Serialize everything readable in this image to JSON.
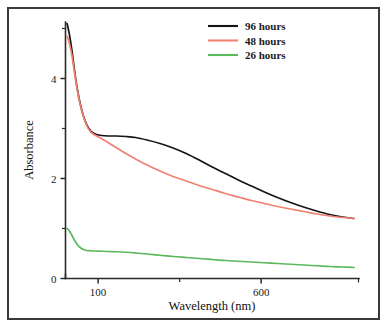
{
  "figure": {
    "border_color": "#3a3a3a",
    "background": "#ffffff"
  },
  "legend": {
    "position": "top-right",
    "entries": [
      {
        "label": "96 hours",
        "color": "#151515"
      },
      {
        "label": "48 hours",
        "color": "#f08070"
      },
      {
        "label": "26 hours",
        "color": "#5cb85c"
      }
    ]
  },
  "axes": {
    "x_title": "Wavelength (nm)",
    "y_title": "Absorbance",
    "x_tick_labels": [
      "100",
      "600"
    ],
    "y_tick_labels": [
      "0",
      "2",
      "4"
    ]
  },
  "chart_data": {
    "type": "line",
    "title": "",
    "xlabel": "Wavelength (nm)",
    "ylabel": "Absorbance",
    "xlim": [
      0,
      900
    ],
    "ylim": [
      0,
      5.4
    ],
    "grid": false,
    "legend_position": "top-right",
    "x_ticks": [
      100,
      600
    ],
    "x_tick_labels": [
      "100",
      "600"
    ],
    "y_ticks": [
      0,
      2,
      4
    ],
    "y_tick_labels": [
      "0",
      "2",
      "4"
    ],
    "y_minor_ticks": [
      1,
      3,
      5
    ],
    "series": [
      {
        "name": "96 hours",
        "color": "#151515",
        "x": [
          5,
          12,
          20,
          28,
          36,
          45,
          55,
          65,
          75,
          85,
          95,
          110,
          130,
          155,
          185,
          215,
          250,
          290,
          330,
          370,
          410,
          450,
          490,
          530,
          570,
          610,
          650,
          690,
          730,
          770,
          810,
          850,
          885
        ],
        "y": [
          5.1,
          4.88,
          4.55,
          4.15,
          3.8,
          3.5,
          3.25,
          3.08,
          2.97,
          2.91,
          2.88,
          2.86,
          2.85,
          2.85,
          2.84,
          2.82,
          2.77,
          2.7,
          2.61,
          2.5,
          2.37,
          2.23,
          2.1,
          1.97,
          1.85,
          1.73,
          1.62,
          1.52,
          1.43,
          1.35,
          1.28,
          1.23,
          1.2
        ]
      },
      {
        "name": "48 hours",
        "color": "#f08070",
        "x": [
          5,
          12,
          20,
          28,
          36,
          45,
          55,
          65,
          75,
          85,
          95,
          110,
          130,
          155,
          185,
          215,
          250,
          290,
          330,
          370,
          410,
          450,
          490,
          530,
          570,
          610,
          650,
          690,
          730,
          770,
          810,
          850,
          885
        ],
        "y": [
          4.85,
          4.7,
          4.45,
          4.1,
          3.78,
          3.48,
          3.24,
          3.06,
          2.95,
          2.89,
          2.85,
          2.8,
          2.72,
          2.62,
          2.5,
          2.39,
          2.27,
          2.15,
          2.04,
          1.95,
          1.86,
          1.78,
          1.7,
          1.63,
          1.56,
          1.5,
          1.44,
          1.39,
          1.34,
          1.29,
          1.25,
          1.22,
          1.2
        ]
      },
      {
        "name": "26 hours",
        "color": "#5cb85c",
        "x": [
          5,
          12,
          20,
          28,
          36,
          45,
          55,
          65,
          75,
          85,
          95,
          110,
          130,
          155,
          185,
          215,
          250,
          290,
          330,
          370,
          410,
          450,
          490,
          530,
          570,
          610,
          650,
          690,
          730,
          770,
          810,
          850,
          885
        ],
        "y": [
          1.0,
          0.95,
          0.86,
          0.76,
          0.68,
          0.62,
          0.58,
          0.56,
          0.555,
          0.55,
          0.55,
          0.545,
          0.54,
          0.535,
          0.525,
          0.51,
          0.49,
          0.465,
          0.44,
          0.42,
          0.4,
          0.38,
          0.36,
          0.345,
          0.33,
          0.315,
          0.3,
          0.285,
          0.27,
          0.255,
          0.24,
          0.23,
          0.22
        ]
      }
    ]
  }
}
